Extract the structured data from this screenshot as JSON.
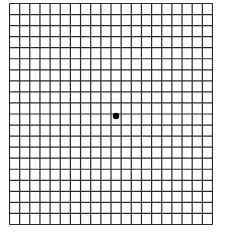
{
  "diagram": {
    "type": "amsler-grid",
    "columns": 20,
    "rows": 20,
    "line_color": "#2a2a2a",
    "background_color": "#ffffff",
    "center_dot_color": "#000000",
    "grid_box": {
      "left": 9,
      "top": 3,
      "width": 203,
      "height": 221
    }
  }
}
